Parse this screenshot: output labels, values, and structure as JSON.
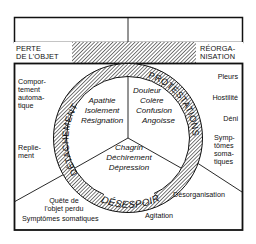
{
  "diagram": {
    "type": "grief-process-cycle",
    "top_band": {
      "left_label": [
        "PERTE",
        "DE L'OBJET"
      ],
      "right_label": [
        "RÉORGA-",
        "NISATION"
      ]
    },
    "ring_phases": [
      {
        "name": "DÉTACHEMENT",
        "position": "left"
      },
      {
        "name": "PROTESTATIONS",
        "position": "right"
      },
      {
        "name": "DÉSESPOIR",
        "position": "bottom"
      }
    ],
    "inner_sectors": [
      {
        "phase": "DÉTACHEMENT",
        "lines": [
          "Apathie",
          "Isolement",
          "Résignation"
        ]
      },
      {
        "phase": "PROTESTATIONS",
        "lines": [
          "Douleur",
          "Colère",
          "Confusion",
          "Angoisse"
        ]
      },
      {
        "phase": "DÉSESPOIR",
        "lines": [
          "Chagrin",
          "Déchirement",
          "Dépression"
        ]
      }
    ],
    "left_behaviors": {
      "upper": [
        "Compor-",
        "tement",
        "automa-",
        "tique"
      ],
      "middle": [
        "Replie-",
        "ment"
      ],
      "lower": [
        "Quête de",
        "l'objet perdu"
      ],
      "bottom": "Symptômes somatiques"
    },
    "right_behaviors": {
      "items": [
        "Pleurs",
        "Hostilité",
        "Déni"
      ],
      "symptoms": [
        "Symp-",
        "tômes",
        "soma-",
        "tiques"
      ],
      "lower": "Désorganisation",
      "bottom": "Agitation"
    }
  }
}
